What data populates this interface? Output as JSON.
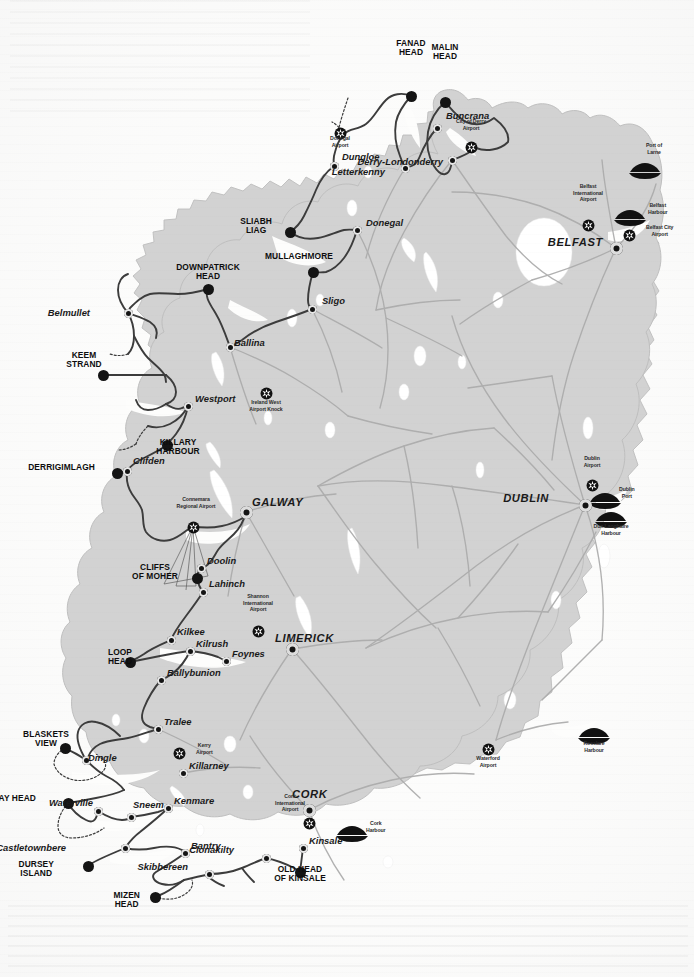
{
  "map": {
    "title": "Wild Atlantic Way – Ireland route map",
    "colors": {
      "land": "#d2d2d2",
      "land_edge": "#b4b4b4",
      "water": "#ffffff",
      "sea": "#fdfdfc",
      "road": "#a9a9a9",
      "route": "#3a3a3a",
      "marker": "#141414",
      "label": "#111111"
    },
    "signature_points": [
      {
        "name": "MALIN HEAD",
        "label": "MALIN\nHEAD",
        "x": 445,
        "y": 102,
        "lx": 445,
        "ly": 52,
        "size": "lg"
      },
      {
        "name": "FANAD HEAD",
        "label": "FANAD\nHEAD",
        "x": 411,
        "y": 96,
        "lx": 411,
        "ly": 48,
        "size": "lg"
      },
      {
        "name": "SLIABH LIAG",
        "label": "SLIABH\nLIAG",
        "x": 290,
        "y": 232,
        "lx": 272,
        "ly": 226,
        "size": "lg"
      },
      {
        "name": "MULLAGHMORE",
        "label": "MULLAGHMORE",
        "x": 313,
        "y": 272,
        "lx": 299,
        "ly": 257,
        "size": "lg"
      },
      {
        "name": "DOWNPATRICK HEAD",
        "label": "DOWNPATRICK\nHEAD",
        "x": 208,
        "y": 289,
        "lx": 208,
        "ly": 272,
        "size": "lg"
      },
      {
        "name": "KEEM STRAND",
        "label": "KEEM\nSTRAND",
        "x": 103,
        "y": 375,
        "lx": 84,
        "ly": 360,
        "size": "lg"
      },
      {
        "name": "KILLARY HARBOUR",
        "label": "KILLARY\nHARBOUR",
        "x": 167,
        "y": 445,
        "lx": 178,
        "ly": 447,
        "size": "lg"
      },
      {
        "name": "DERRIGIMLAGH",
        "label": "DERRIGIMLAGH",
        "x": 117,
        "y": 473,
        "lx": 95,
        "ly": 468,
        "size": "lg"
      },
      {
        "name": "CLIFFS OF MOHER",
        "label": "CLIFFS\nOF MOHER",
        "x": 197,
        "y": 578,
        "lx": 178,
        "ly": 572,
        "size": "lg"
      },
      {
        "name": "LOOP HEAD",
        "label": "LOOP\nHEAD",
        "x": 130,
        "y": 662,
        "lx": 120,
        "ly": 657,
        "size": "lg"
      },
      {
        "name": "BLASKETS VIEW",
        "label": "BLASKETS\nVIEW",
        "x": 65,
        "y": 748,
        "lx": 46,
        "ly": 739,
        "size": "lg"
      },
      {
        "name": "BRAY HEAD",
        "label": "BRAY HEAD",
        "x": 68,
        "y": 803,
        "lx": 36,
        "ly": 799,
        "size": "lg"
      },
      {
        "name": "DURSEY ISLAND",
        "label": "DURSEY\nISLAND",
        "x": 88,
        "y": 866,
        "lx": 54,
        "ly": 869,
        "size": "lg"
      },
      {
        "name": "MIZEN HEAD",
        "label": "MIZEN\nHEAD",
        "x": 155,
        "y": 897,
        "lx": 140,
        "ly": 900,
        "size": "lg"
      },
      {
        "name": "OLD HEAD OF KINSALE",
        "label": "OLD HEAD\nOF KINSALE",
        "x": 300,
        "y": 872,
        "lx": 300,
        "ly": 874,
        "size": "lg"
      }
    ],
    "towns": [
      {
        "name": "Dungloe",
        "label": "Dungloe",
        "x": 334,
        "y": 166,
        "lx": 342,
        "ly": 157
      },
      {
        "name": "Buncrana",
        "label": "Buncrana",
        "x": 437,
        "y": 128,
        "lx": 446,
        "ly": 116
      },
      {
        "name": "Letterkenny",
        "label": "Letterkenny",
        "x": 405,
        "y": 168,
        "lx": 385,
        "ly": 172
      },
      {
        "name": "Derry-Londonderry",
        "label": "Derry-Londonderry",
        "x": 452,
        "y": 160,
        "lx": 443,
        "ly": 162
      },
      {
        "name": "Donegal",
        "label": "Donegal",
        "x": 357,
        "y": 230,
        "lx": 366,
        "ly": 223
      },
      {
        "name": "Sligo",
        "label": "Sligo",
        "x": 312,
        "y": 309,
        "lx": 322,
        "ly": 301
      },
      {
        "name": "Ballina",
        "label": "Ballina",
        "x": 230,
        "y": 347,
        "lx": 234,
        "ly": 343
      },
      {
        "name": "Belmullet",
        "label": "Belmullet",
        "x": 128,
        "y": 313,
        "lx": 90,
        "ly": 313
      },
      {
        "name": "Westport",
        "label": "Westport",
        "x": 188,
        "y": 406,
        "lx": 195,
        "ly": 399
      },
      {
        "name": "Clifden",
        "label": "Clifden",
        "x": 127,
        "y": 471,
        "lx": 133,
        "ly": 461
      },
      {
        "name": "Doolin",
        "label": "Doolin",
        "x": 201,
        "y": 568,
        "lx": 207,
        "ly": 561
      },
      {
        "name": "Lahinch",
        "label": "Lahinch",
        "x": 203,
        "y": 592,
        "lx": 209,
        "ly": 584
      },
      {
        "name": "Kilkee",
        "label": "Kilkee",
        "x": 171,
        "y": 640,
        "lx": 177,
        "ly": 632
      },
      {
        "name": "Kilrush",
        "label": "Kilrush",
        "x": 190,
        "y": 651,
        "lx": 196,
        "ly": 644
      },
      {
        "name": "Foynes",
        "label": "Foynes",
        "x": 226,
        "y": 661,
        "lx": 232,
        "ly": 654
      },
      {
        "name": "Ballybunion",
        "label": "Ballybunion",
        "x": 161,
        "y": 680,
        "lx": 167,
        "ly": 673
      },
      {
        "name": "Tralee",
        "label": "Tralee",
        "x": 158,
        "y": 729,
        "lx": 164,
        "ly": 722
      },
      {
        "name": "Dingle",
        "label": "Dingle",
        "x": 86,
        "y": 760,
        "lx": 88,
        "ly": 758
      },
      {
        "name": "Killarney",
        "label": "Killarney",
        "x": 183,
        "y": 773,
        "lx": 189,
        "ly": 766
      },
      {
        "name": "Waterville",
        "label": "Waterville",
        "x": 98,
        "y": 811,
        "lx": 93,
        "ly": 803
      },
      {
        "name": "Sneem",
        "label": "Sneem",
        "x": 131,
        "y": 817,
        "lx": 133,
        "ly": 805
      },
      {
        "name": "Kenmare",
        "label": "Kenmare",
        "x": 168,
        "y": 808,
        "lx": 174,
        "ly": 801
      },
      {
        "name": "Castletownbere",
        "label": "Castletownbere",
        "x": 125,
        "y": 848,
        "lx": 66,
        "ly": 848
      },
      {
        "name": "Bantry",
        "label": "Bantry",
        "x": 185,
        "y": 853,
        "lx": 191,
        "ly": 846
      },
      {
        "name": "Skibbereen",
        "label": "Skibbereen",
        "x": 209,
        "y": 874,
        "lx": 188,
        "ly": 867
      },
      {
        "name": "Clonakilty",
        "label": "Clonakilty",
        "x": 266,
        "y": 858,
        "lx": 234,
        "ly": 850
      },
      {
        "name": "Kinsale",
        "label": "Kinsale",
        "x": 303,
        "y": 848,
        "lx": 309,
        "ly": 841
      }
    ],
    "cities": [
      {
        "name": "BELFAST",
        "label": "BELFAST",
        "x": 616,
        "y": 248,
        "lx": 603,
        "ly": 243,
        "align": "right"
      },
      {
        "name": "DUBLIN",
        "label": "DUBLIN",
        "x": 585,
        "y": 505,
        "lx": 549,
        "ly": 499,
        "align": "right"
      },
      {
        "name": "GALWAY",
        "label": "GALWAY",
        "x": 246,
        "y": 512,
        "lx": 252,
        "ly": 503
      },
      {
        "name": "LIMERICK",
        "label": "LIMERICK",
        "x": 292,
        "y": 649,
        "lx": 275,
        "ly": 639
      },
      {
        "name": "CORK",
        "label": "CORK",
        "x": 309,
        "y": 810,
        "lx": 292,
        "ly": 795
      }
    ],
    "airports": [
      {
        "name": "Donegal Airport",
        "label": "Donegal\nAirport",
        "x": 340,
        "y": 132,
        "lx": 340,
        "ly": 135
      },
      {
        "name": "City of Derry Airport",
        "label": "City of Derry\nAirport",
        "x": 471,
        "y": 146,
        "lx": 471,
        "ly": 131
      },
      {
        "name": "Belfast International Airport",
        "label": "Belfast\nInternational\nAirport",
        "x": 588,
        "y": 224,
        "lx": 588,
        "ly": 202
      },
      {
        "name": "Belfast City Airport",
        "label": "Belfast City\nAirport",
        "x": 629,
        "y": 234,
        "lx": 646,
        "ly": 230
      },
      {
        "name": "Ireland West Airport Knock",
        "label": "Ireland West\nAirport Knock",
        "x": 266,
        "y": 392,
        "lx": 266,
        "ly": 399
      },
      {
        "name": "Connemara Regional Airport",
        "label": "Connemara\nRegional Airport",
        "x": 193,
        "y": 526,
        "lx": 196,
        "ly": 509
      },
      {
        "name": "Shannon International Airport",
        "label": "Shannon\nInternational\nAirport",
        "x": 258,
        "y": 630,
        "lx": 258,
        "ly": 612
      },
      {
        "name": "Dublin Airport",
        "label": "Dublin\nAirport",
        "x": 592,
        "y": 484,
        "lx": 592,
        "ly": 468
      },
      {
        "name": "Kerry Airport",
        "label": "Kerry\nAirport",
        "x": 179,
        "y": 752,
        "lx": 196,
        "ly": 748
      },
      {
        "name": "Cork International Airport",
        "label": "Cork\nInternational\nAirport",
        "x": 309,
        "y": 822,
        "lx": 290,
        "ly": 812
      },
      {
        "name": "Waterford Airport",
        "label": "Waterford\nAirport",
        "x": 488,
        "y": 748,
        "lx": 488,
        "ly": 755
      }
    ],
    "harbours": [
      {
        "name": "Port of Larne",
        "label": "Port of\nLarne",
        "x": 645,
        "y": 170,
        "lx": 654,
        "ly": 155
      },
      {
        "name": "Belfast Harbour",
        "label": "Belfast\nHarbour",
        "x": 630,
        "y": 217,
        "lx": 648,
        "ly": 208
      },
      {
        "name": "Dublin Port",
        "label": "Dublin\nPort",
        "x": 605,
        "y": 500,
        "lx": 619,
        "ly": 492
      },
      {
        "name": "Dun Laoghaire Harbour",
        "label": "Dun Laoghaire\nHarbour",
        "x": 611,
        "y": 519,
        "lx": 611,
        "ly": 523
      },
      {
        "name": "Rosslare Harbour",
        "label": "Rosslare\nHarbour",
        "x": 594,
        "y": 735,
        "lx": 594,
        "ly": 740
      },
      {
        "name": "Cork Harbour",
        "label": "Cork\nHarbour",
        "x": 352,
        "y": 833,
        "lx": 366,
        "ly": 826
      }
    ]
  }
}
